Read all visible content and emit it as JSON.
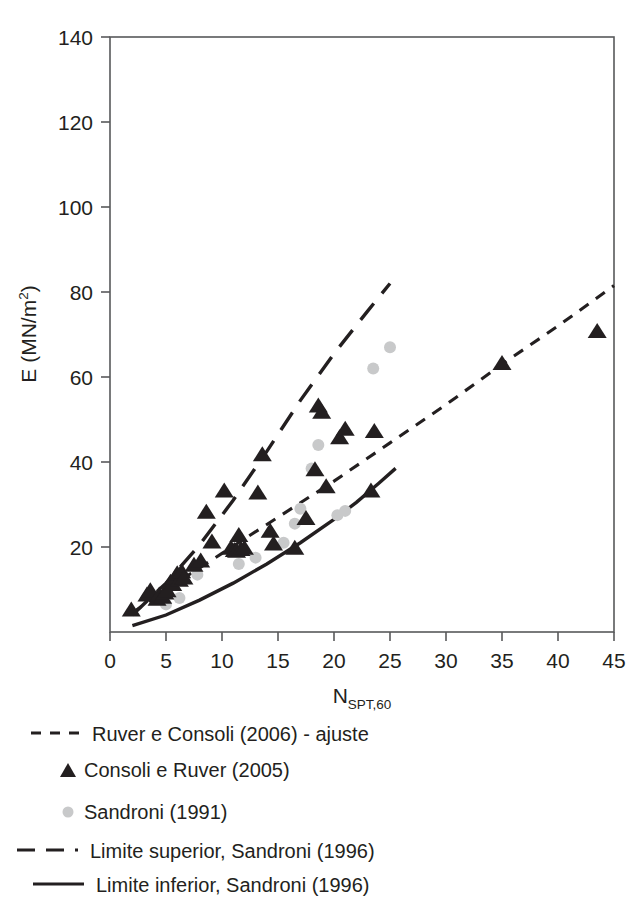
{
  "chart_data": {
    "type": "scatter",
    "title": "",
    "xlabel": "N_SPT,60",
    "xlabel_base": "N",
    "xlabel_sub": "SPT,60",
    "ylabel": "E (MN/m2)",
    "ylabel_base": "E (MN/m",
    "ylabel_sup": "2",
    "ylabel_close": ")",
    "xlim": [
      0,
      45
    ],
    "ylim": [
      0,
      140
    ],
    "xticks": [
      0,
      5,
      10,
      15,
      20,
      25,
      30,
      35,
      40,
      45
    ],
    "yticks": [
      0,
      20,
      40,
      60,
      80,
      100,
      120,
      140
    ],
    "ytick_labels": [
      "",
      "20",
      "40",
      "60",
      "80",
      "100",
      "120",
      "140"
    ],
    "grid": false,
    "legend_position": "below-axes",
    "series": [
      {
        "name": "Ruver e Consoli  (2006) - ajuste",
        "type": "line",
        "style": "short-dashed",
        "color": "#231f20",
        "points": [
          [
            2.0,
            4.5
          ],
          [
            5.0,
            10.0
          ],
          [
            10.0,
            18.5
          ],
          [
            15.0,
            27.0
          ],
          [
            20.0,
            35.5
          ],
          [
            25.0,
            44.5
          ],
          [
            30.0,
            53.5
          ],
          [
            35.0,
            63.0
          ],
          [
            40.0,
            72.0
          ],
          [
            45.0,
            81.5
          ]
        ]
      },
      {
        "name": "Consoli e Ruver (2005)",
        "type": "scatter",
        "marker": "triangle",
        "color": "#231f20",
        "points": [
          [
            1.9,
            5.0
          ],
          [
            3.3,
            8.5
          ],
          [
            3.6,
            9.5
          ],
          [
            4.2,
            7.5
          ],
          [
            4.4,
            8.5
          ],
          [
            4.7,
            8.0
          ],
          [
            4.9,
            9.0
          ],
          [
            5.1,
            9.5
          ],
          [
            5.4,
            11.5
          ],
          [
            5.6,
            11.0
          ],
          [
            5.8,
            12.5
          ],
          [
            6.0,
            13.5
          ],
          [
            6.2,
            12.0
          ],
          [
            6.4,
            14.0
          ],
          [
            6.6,
            12.5
          ],
          [
            7.5,
            15.5
          ],
          [
            8.1,
            16.5
          ],
          [
            8.6,
            28.0
          ],
          [
            9.1,
            21.0
          ],
          [
            10.2,
            33.0
          ],
          [
            10.8,
            19.5
          ],
          [
            11.1,
            19.0
          ],
          [
            11.3,
            18.8
          ],
          [
            11.5,
            22.5
          ],
          [
            11.7,
            19.2
          ],
          [
            12.0,
            19.5
          ],
          [
            13.2,
            32.5
          ],
          [
            13.6,
            41.5
          ],
          [
            14.3,
            23.5
          ],
          [
            14.6,
            20.5
          ],
          [
            16.5,
            19.5
          ],
          [
            17.5,
            26.5
          ],
          [
            18.3,
            38.0
          ],
          [
            18.6,
            53.0
          ],
          [
            18.9,
            51.5
          ],
          [
            19.3,
            34.0
          ],
          [
            20.5,
            45.5
          ],
          [
            21.0,
            47.5
          ],
          [
            23.3,
            33.0
          ],
          [
            23.6,
            47.0
          ],
          [
            35.0,
            63.0
          ],
          [
            43.5,
            70.5
          ]
        ]
      },
      {
        "name": "Sandroni (1991)",
        "type": "scatter",
        "marker": "circle",
        "color": "#c8c9ca",
        "points": [
          [
            5.0,
            6.5
          ],
          [
            6.2,
            8.0
          ],
          [
            7.8,
            13.5
          ],
          [
            11.5,
            16.0
          ],
          [
            13.0,
            17.5
          ],
          [
            15.5,
            21.0
          ],
          [
            16.5,
            25.5
          ],
          [
            17.0,
            29.0
          ],
          [
            18.0,
            38.5
          ],
          [
            18.6,
            44.0
          ],
          [
            20.3,
            27.5
          ],
          [
            21.0,
            28.5
          ],
          [
            23.5,
            62.0
          ],
          [
            25.0,
            67.0
          ]
        ]
      },
      {
        "name": "Limite superior, Sandroni (1996)",
        "type": "line",
        "style": "long-dashed",
        "color": "#231f20",
        "points": [
          [
            2.0,
            4.0
          ],
          [
            5.0,
            11.5
          ],
          [
            8.0,
            20.5
          ],
          [
            11.0,
            31.0
          ],
          [
            14.0,
            42.5
          ],
          [
            17.0,
            54.5
          ],
          [
            20.0,
            65.5
          ],
          [
            23.0,
            75.5
          ],
          [
            25.0,
            82.0
          ]
        ]
      },
      {
        "name": "Limite inferior, Sandroni (1996)",
        "type": "line",
        "style": "solid",
        "color": "#231f20",
        "points": [
          [
            2.0,
            1.5
          ],
          [
            5.0,
            4.0
          ],
          [
            8.0,
            7.5
          ],
          [
            11.0,
            11.5
          ],
          [
            14.0,
            16.0
          ],
          [
            17.0,
            21.0
          ],
          [
            20.0,
            26.5
          ],
          [
            22.0,
            30.5
          ],
          [
            24.0,
            35.0
          ],
          [
            25.5,
            38.5
          ]
        ]
      }
    ]
  },
  "legend": {
    "items": [
      {
        "marker": "short-dashed-line",
        "label": "Ruver e Consoli  (2006) - ajuste"
      },
      {
        "marker": "triangle",
        "label": "Consoli e Ruver (2005)"
      },
      {
        "marker": "gray-circle",
        "label": "Sandroni (1991)"
      },
      {
        "marker": "long-dashed-line",
        "label": "Limite superior, Sandroni (1996)"
      },
      {
        "marker": "solid-line",
        "label": "Limite inferior, Sandroni (1996)"
      }
    ]
  },
  "colors": {
    "ink": "#231f20",
    "axis": "#58595b",
    "sandroni_marker": "#c8c9ca",
    "background": "#ffffff"
  }
}
